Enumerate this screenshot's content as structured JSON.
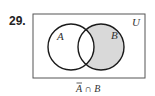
{
  "problem_number": "29.",
  "diagram": {
    "type": "venn",
    "universe_label": "U",
    "sets": [
      {
        "label": "A",
        "shaded": false
      },
      {
        "label": "B",
        "shaded": true
      }
    ],
    "shaded_region": "B only (outside A)",
    "caption_prefix": "A",
    "caption_rest": " ∩ B",
    "shade_color": "#d9d9d9",
    "line_color": "#1a1a1a"
  }
}
